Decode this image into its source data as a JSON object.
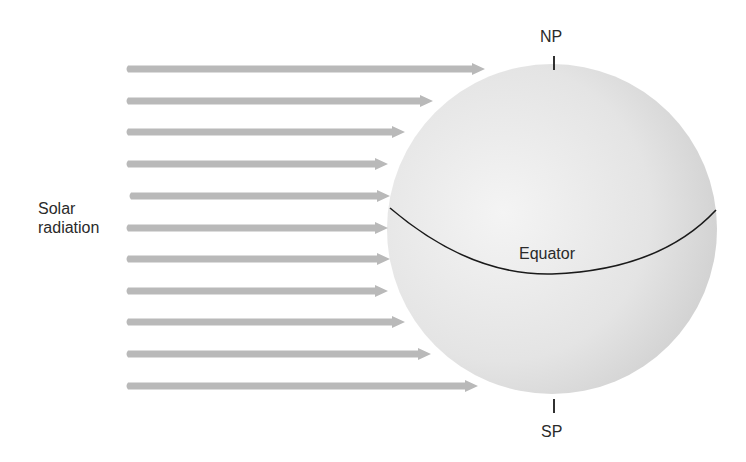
{
  "labels": {
    "solar_radiation_line1": "Solar",
    "solar_radiation_line2": "radiation",
    "north_pole": "NP",
    "south_pole": "SP",
    "equator": "Equator"
  },
  "colors": {
    "arrow": "#b9b9b9",
    "sphere_light": "#f2f2f2",
    "sphere_dark": "#cfcfcf",
    "line": "#1a1a1a",
    "text": "#2a2a2a"
  },
  "sphere": {
    "cx": 552,
    "cy": 229,
    "r": 165
  },
  "arrows": [
    {
      "y": 69,
      "x_start": 128,
      "x_tip": 485
    },
    {
      "y": 101,
      "x_start": 128,
      "x_tip": 433
    },
    {
      "y": 132,
      "x_start": 128,
      "x_tip": 405
    },
    {
      "y": 164,
      "x_start": 128,
      "x_tip": 388
    },
    {
      "y": 196,
      "x_start": 131,
      "x_tip": 390
    },
    {
      "y": 228,
      "x_start": 128,
      "x_tip": 388
    },
    {
      "y": 259,
      "x_start": 128,
      "x_tip": 390
    },
    {
      "y": 291,
      "x_start": 128,
      "x_tip": 388
    },
    {
      "y": 322,
      "x_start": 128,
      "x_tip": 405
    },
    {
      "y": 354,
      "x_start": 128,
      "x_tip": 431
    },
    {
      "y": 386,
      "x_start": 128,
      "x_tip": 478
    }
  ]
}
